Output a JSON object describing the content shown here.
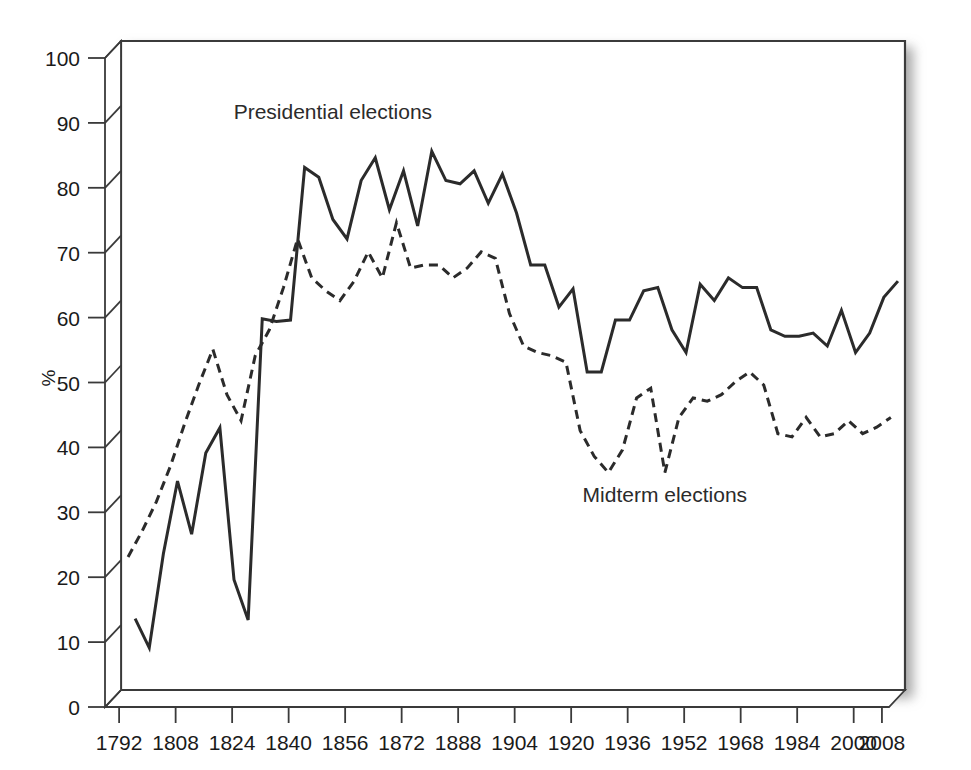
{
  "chart_data": {
    "type": "line",
    "title": "",
    "subtitle": "",
    "xlabel": "",
    "ylabel": "%",
    "xlim": [
      1788,
      2010
    ],
    "ylim": [
      0,
      100
    ],
    "grid": false,
    "legend_position": "inline-annotations",
    "xticks": [
      1792,
      1808,
      1824,
      1840,
      1856,
      1872,
      1888,
      1904,
      1920,
      1936,
      1952,
      1968,
      1984,
      2000,
      2008
    ],
    "yticks": [
      0,
      10,
      20,
      30,
      40,
      50,
      60,
      70,
      80,
      90,
      100
    ],
    "annotations": [
      {
        "text": "Presidential elections",
        "x": 1848,
        "y": 88
      },
      {
        "text": "Midterm elections",
        "x": 1942,
        "y": 29
      }
    ],
    "series": [
      {
        "name": "Presidential elections",
        "style": "solid",
        "color": "#2b2b2b",
        "points": [
          [
            1792,
            11.0
          ],
          [
            1796,
            6.5
          ],
          [
            1800,
            21.0
          ],
          [
            1804,
            32.2
          ],
          [
            1808,
            24.0
          ],
          [
            1812,
            36.5
          ],
          [
            1816,
            40.4
          ],
          [
            1820,
            17.0
          ],
          [
            1824,
            10.8
          ],
          [
            1828,
            57.2
          ],
          [
            1832,
            56.8
          ],
          [
            1836,
            57.0
          ],
          [
            1840,
            80.5
          ],
          [
            1844,
            79.0
          ],
          [
            1848,
            72.5
          ],
          [
            1852,
            69.5
          ],
          [
            1856,
            78.5
          ],
          [
            1860,
            82.0
          ],
          [
            1864,
            74.0
          ],
          [
            1868,
            80.0
          ],
          [
            1872,
            71.5
          ],
          [
            1876,
            83.0
          ],
          [
            1880,
            78.5
          ],
          [
            1884,
            78.0
          ],
          [
            1888,
            80.0
          ],
          [
            1892,
            75.0
          ],
          [
            1896,
            79.5
          ],
          [
            1900,
            73.5
          ],
          [
            1904,
            65.5
          ],
          [
            1908,
            65.5
          ],
          [
            1912,
            59.0
          ],
          [
            1916,
            61.8
          ],
          [
            1920,
            49.0
          ],
          [
            1924,
            49.0
          ],
          [
            1928,
            57.0
          ],
          [
            1932,
            57.0
          ],
          [
            1936,
            61.5
          ],
          [
            1940,
            62.0
          ],
          [
            1944,
            55.5
          ],
          [
            1948,
            52.0
          ],
          [
            1952,
            62.5
          ],
          [
            1956,
            60.0
          ],
          [
            1960,
            63.5
          ],
          [
            1964,
            62.0
          ],
          [
            1968,
            62.0
          ],
          [
            1972,
            55.5
          ],
          [
            1976,
            54.5
          ],
          [
            1980,
            54.5
          ],
          [
            1984,
            55.0
          ],
          [
            1988,
            53.0
          ],
          [
            1992,
            58.5
          ],
          [
            1996,
            52.0
          ],
          [
            2000,
            55.0
          ],
          [
            2004,
            60.5
          ],
          [
            2008,
            63.0
          ]
        ]
      },
      {
        "name": "Midterm elections",
        "style": "dashed",
        "color": "#2b2b2b",
        "points": [
          [
            1790,
            20.5
          ],
          [
            1794,
            24.5
          ],
          [
            1798,
            29.0
          ],
          [
            1802,
            34.5
          ],
          [
            1806,
            41.0
          ],
          [
            1810,
            47.0
          ],
          [
            1814,
            52.5
          ],
          [
            1818,
            45.5
          ],
          [
            1822,
            41.5
          ],
          [
            1826,
            51.5
          ],
          [
            1830,
            55.5
          ],
          [
            1834,
            62.0
          ],
          [
            1838,
            69.5
          ],
          [
            1842,
            63.5
          ],
          [
            1846,
            61.5
          ],
          [
            1850,
            60.0
          ],
          [
            1854,
            63.0
          ],
          [
            1858,
            67.5
          ],
          [
            1862,
            63.5
          ],
          [
            1866,
            72.0
          ],
          [
            1870,
            65.0
          ],
          [
            1874,
            65.5
          ],
          [
            1878,
            65.5
          ],
          [
            1882,
            63.5
          ],
          [
            1886,
            65.0
          ],
          [
            1890,
            67.5
          ],
          [
            1894,
            66.5
          ],
          [
            1898,
            58.0
          ],
          [
            1902,
            53.0
          ],
          [
            1906,
            52.0
          ],
          [
            1910,
            51.5
          ],
          [
            1914,
            50.5
          ],
          [
            1918,
            40.0
          ],
          [
            1922,
            36.0
          ],
          [
            1926,
            33.5
          ],
          [
            1930,
            37.0
          ],
          [
            1934,
            45.0
          ],
          [
            1938,
            46.5
          ],
          [
            1942,
            33.5
          ],
          [
            1946,
            42.0
          ],
          [
            1950,
            45.0
          ],
          [
            1954,
            44.5
          ],
          [
            1958,
            45.5
          ],
          [
            1962,
            47.5
          ],
          [
            1966,
            49.0
          ],
          [
            1970,
            47.0
          ],
          [
            1974,
            39.5
          ],
          [
            1978,
            39.0
          ],
          [
            1982,
            42.0
          ],
          [
            1986,
            39.0
          ],
          [
            1990,
            39.5
          ],
          [
            1994,
            41.5
          ],
          [
            1998,
            39.5
          ],
          [
            2002,
            40.5
          ],
          [
            2006,
            42.0
          ]
        ]
      }
    ]
  }
}
